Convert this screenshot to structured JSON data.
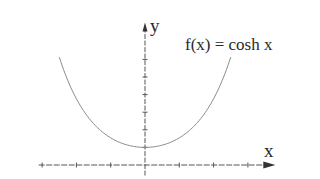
{
  "chart_data": {
    "type": "line",
    "title": "",
    "function_label": "f(x) = cosh x",
    "xlabel": "x",
    "ylabel": "y",
    "series": [
      {
        "name": "f(x) = cosh x",
        "x": [
          -2.5,
          -2.0,
          -1.5,
          -1.0,
          -0.5,
          0.0,
          0.5,
          1.0,
          1.5,
          2.0,
          2.5
        ],
        "values": [
          6.13,
          3.76,
          2.35,
          1.54,
          1.13,
          1.0,
          1.13,
          1.54,
          2.35,
          3.76,
          6.13
        ]
      }
    ],
    "xlim": [
      -3.1,
      3.8
    ],
    "ylim": [
      -0.6,
      8.1
    ],
    "x_ticks": [
      -3,
      -2,
      -1,
      0,
      1,
      2,
      3
    ],
    "y_ticks": [
      1,
      2,
      3,
      4,
      5,
      6
    ],
    "tick_labels_shown": false,
    "grid": false,
    "legend": "none",
    "colors": {
      "axis": "#555555",
      "curve": "#8a8a8a",
      "text": "#2a2a2a"
    }
  },
  "labels": {
    "y_axis": "y",
    "x_axis": "x",
    "function": "f(x) = cosh x"
  }
}
